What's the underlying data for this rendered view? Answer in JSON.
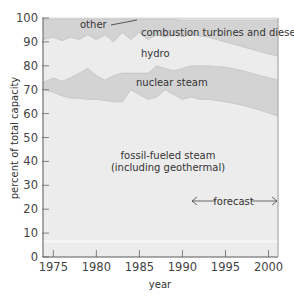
{
  "chart_data": {
    "type": "area",
    "title": "",
    "xlabel": "year",
    "ylabel": "percent of total capacity",
    "xlim": [
      1973.8,
      2001.1
    ],
    "ylim": [
      0,
      100
    ],
    "x_ticks": [
      1975,
      1980,
      1985,
      1990,
      1995,
      2000
    ],
    "y_ticks": [
      0,
      10,
      20,
      30,
      40,
      50,
      60,
      70,
      80,
      90,
      100
    ],
    "grid": false,
    "legend": "inline labels",
    "stacked": true,
    "boundaries_note": "Cumulative upper boundary (percent) of each stacked band, bottom to top",
    "x": [
      1973.8,
      1975,
      1976,
      1977,
      1978,
      1979,
      1980,
      1981,
      1982,
      1983,
      1984,
      1985,
      1986,
      1987,
      1988,
      1989,
      1990,
      1991,
      1992,
      1993,
      1995,
      1997,
      1999,
      2001.1
    ],
    "series": [
      {
        "name": "fossil-fueled steam (including geothermal)",
        "cumulative_top": [
          70,
          69,
          67.5,
          66.5,
          66.5,
          66,
          66,
          65.5,
          65,
          65,
          70,
          68,
          66,
          67,
          70,
          68,
          66,
          67,
          66,
          66,
          65,
          63.5,
          61.5,
          59
        ]
      },
      {
        "name": "nuclear steam",
        "cumulative_top": [
          73,
          75,
          73.5,
          75,
          77,
          79,
          76,
          74,
          76,
          77,
          77,
          77,
          77,
          80,
          79,
          78,
          79,
          80,
          80,
          80,
          79.5,
          78,
          76,
          74
        ]
      },
      {
        "name": "hydro",
        "cumulative_top": [
          91,
          92,
          90.5,
          92,
          91,
          93,
          91,
          93,
          90,
          94,
          91,
          94,
          91,
          93,
          92,
          93,
          92,
          93,
          92.5,
          92,
          90,
          88,
          86,
          84
        ]
      },
      {
        "name": "combustion turbines and diesel",
        "cumulative_top": [
          99.5,
          99.5,
          99.5,
          99.5,
          99.5,
          99.5,
          99.5,
          99.5,
          99.5,
          99.5,
          99.5,
          99.5,
          99.5,
          99.5,
          99.5,
          99.5,
          99,
          99,
          99,
          99,
          99,
          99,
          99,
          99
        ]
      },
      {
        "name": "other",
        "cumulative_top": [
          100,
          100,
          100,
          100,
          100,
          100,
          100,
          100,
          100,
          100,
          100,
          100,
          100,
          100,
          100,
          100,
          100,
          100,
          100,
          100,
          100,
          100,
          100,
          100
        ]
      }
    ],
    "annotations": [
      {
        "text": "forecast",
        "x_range": [
          1991.5,
          2001
        ],
        "y": 23,
        "style": "double-headed arrow"
      }
    ]
  },
  "labels": {
    "other": "other",
    "combustion": "combustion turbines and diesel",
    "hydro": "hydro",
    "nuclear": "nuclear steam",
    "fossil_line1": "fossil-fueled steam",
    "fossil_line2": "(including geothermal)",
    "forecast": "forecast",
    "xlabel": "year",
    "ylabel": "percent of total capacity"
  },
  "axis": {
    "y_ticks": [
      "0",
      "10",
      "20",
      "30",
      "40",
      "50",
      "60",
      "70",
      "80",
      "90",
      "100"
    ],
    "x_ticks": [
      "1975",
      "1980",
      "1985",
      "1990",
      "1995",
      "2000"
    ]
  },
  "colors": {
    "band_dark": "#d3d3d3",
    "band_light": "#ececec",
    "axis": "#666666",
    "text": "#333333"
  }
}
